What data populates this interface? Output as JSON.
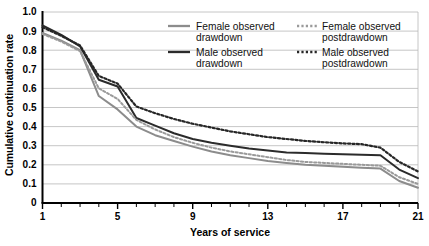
{
  "chart_data": {
    "type": "line",
    "title": "",
    "xlabel": "Years of service",
    "ylabel": "Cumulative continuation rate",
    "xlim": [
      1,
      21
    ],
    "ylim": [
      0,
      1.0
    ],
    "grid": true,
    "legend_position": "top-right inside plot",
    "x": [
      1,
      2,
      3,
      4,
      5,
      6,
      7,
      8,
      9,
      10,
      11,
      12,
      13,
      14,
      15,
      16,
      17,
      18,
      19,
      20,
      21
    ],
    "xticks": [
      "1",
      "5",
      "9",
      "13",
      "17",
      "21"
    ],
    "xtick_values": [
      1,
      5,
      9,
      13,
      17,
      21
    ],
    "yticks": [
      "0",
      "0.1",
      "0.2",
      "0.3",
      "0.4",
      "0.5",
      "0.6",
      "0.7",
      "0.8",
      "0.9",
      "1.0"
    ],
    "ytick_values": [
      0,
      0.1,
      0.2,
      0.3,
      0.4,
      0.5,
      0.6,
      0.7,
      0.8,
      0.9,
      1.0
    ],
    "series": [
      {
        "name": "Female observed drawdown",
        "style": "solid",
        "color": "#8c8c8c",
        "width": 2.0,
        "values": [
          0.89,
          0.85,
          0.8,
          0.56,
          0.49,
          0.4,
          0.355,
          0.325,
          0.295,
          0.27,
          0.25,
          0.235,
          0.22,
          0.21,
          0.2,
          0.195,
          0.19,
          0.185,
          0.18,
          0.115,
          0.08
        ]
      },
      {
        "name": "Male observed drawdown",
        "style": "solid",
        "color": "#2b2b2b",
        "width": 2.0,
        "values": [
          0.93,
          0.88,
          0.82,
          0.645,
          0.61,
          0.445,
          0.405,
          0.365,
          0.335,
          0.315,
          0.3,
          0.285,
          0.275,
          0.265,
          0.262,
          0.258,
          0.255,
          0.252,
          0.25,
          0.175,
          0.13
        ]
      },
      {
        "name": "Female observed postdrawdown",
        "style": "dotted",
        "color": "#9a9a9a",
        "width": 2.0,
        "values": [
          0.885,
          0.845,
          0.795,
          0.6,
          0.545,
          0.435,
          0.385,
          0.345,
          0.315,
          0.29,
          0.27,
          0.255,
          0.24,
          0.225,
          0.215,
          0.21,
          0.205,
          0.2,
          0.195,
          0.135,
          0.1
        ]
      },
      {
        "name": "Male observed postdrawdown",
        "style": "dotted",
        "color": "#262626",
        "width": 2.2,
        "values": [
          0.92,
          0.875,
          0.825,
          0.665,
          0.625,
          0.505,
          0.47,
          0.44,
          0.415,
          0.395,
          0.375,
          0.36,
          0.345,
          0.335,
          0.325,
          0.318,
          0.312,
          0.308,
          0.29,
          0.215,
          0.165
        ]
      }
    ]
  },
  "legend": {
    "items": [
      {
        "label_line1": "Female observed",
        "label_line2": "drawdown",
        "style": "solid",
        "color": "#8c8c8c"
      },
      {
        "label_line1": "Female observed",
        "label_line2": "postdrawdown",
        "style": "dotted",
        "color": "#9a9a9a"
      },
      {
        "label_line1": "Male observed",
        "label_line2": "drawdown",
        "style": "solid",
        "color": "#2b2b2b"
      },
      {
        "label_line1": "Male observed",
        "label_line2": "postdrawdown",
        "style": "dotted",
        "color": "#262626"
      }
    ]
  },
  "axes": {
    "x_title": "Years of service",
    "y_title": "Cumulative continuation rate"
  },
  "colors": {
    "axis": "#000000",
    "grid": "#b8b8b8",
    "background": "#ffffff"
  }
}
